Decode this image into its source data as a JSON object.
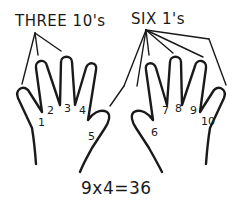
{
  "labels": {
    "left_title": "THREE 10's",
    "right_title": "SIX 1's",
    "equation": "9x4=36"
  },
  "fingers": {
    "left_hand": [
      "1",
      "2",
      "3",
      "4",
      "5"
    ],
    "right_hand": [
      "6",
      "7",
      "8",
      "9",
      "10"
    ]
  },
  "colors": {
    "ink": "#1a1a1a",
    "background": "#ffffff"
  }
}
